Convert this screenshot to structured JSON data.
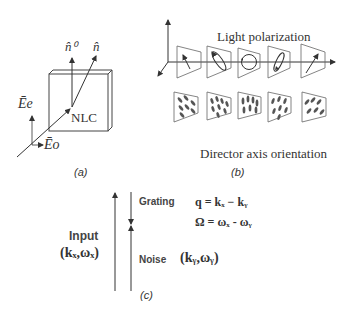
{
  "panel_a": {
    "caption": "(a)",
    "labels": {
      "n0": "n̂⁰",
      "n": "n̂",
      "Ee": "Ēe",
      "Eo": "Ēo",
      "nlc": "NLC"
    }
  },
  "panel_b": {
    "caption": "(b)",
    "top_title": "Light polarization",
    "bottom_title": "Director axis orientation",
    "polarization_states": [
      "linear-tilted-left",
      "elliptical-tilted",
      "circular",
      "elliptical-tilted-right",
      "linear-tilted-right"
    ]
  },
  "panel_c": {
    "caption": "(c)",
    "input_label": "Input",
    "input_vector": "(kₓ,ωₓ)",
    "grating_label": "Grating",
    "grating_q": "q = kₓ − kᵧ",
    "grating_omega": "Ω = ωₓ - ωᵧ",
    "noise_label": "Noise",
    "noise_vector": "(kᵧ,ωᵧ)"
  }
}
